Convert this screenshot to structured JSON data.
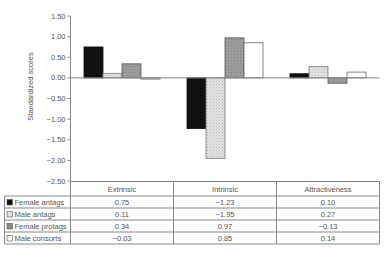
{
  "chart_data": {
    "type": "bar",
    "title": "",
    "xlabel": "",
    "ylabel": "Standardized scores",
    "ylim": [
      -2.5,
      1.5
    ],
    "yticks": [
      1.5,
      1.0,
      0.5,
      0.0,
      -0.5,
      -1.0,
      -1.5,
      -2.0,
      -2.5
    ],
    "ytick_labels": [
      "1.50",
      "1.00",
      "0.50",
      "0.00",
      "−0.50",
      "−1.00",
      "−1.50",
      "−2.00",
      "−2.50"
    ],
    "grid": false,
    "legend_position": "data-table-left",
    "categories": [
      "Extrinsic",
      "Intrinsic",
      "Attractiveness"
    ],
    "series": [
      {
        "name": "Female antags",
        "values": [
          0.75,
          -1.23,
          0.1
        ],
        "labels": [
          "0.75",
          "−1.23",
          "0.10"
        ],
        "fill": "#111111",
        "pattern": "solid-black"
      },
      {
        "name": "Male antags",
        "values": [
          0.11,
          -1.95,
          0.27
        ],
        "labels": [
          "0.11",
          "−1.95",
          "0.27"
        ],
        "fill": "#dcdcdc",
        "pattern": "light-dotted"
      },
      {
        "name": "Female protags",
        "values": [
          0.34,
          0.97,
          -0.13
        ],
        "labels": [
          "0.34",
          "0.97",
          "−0.13"
        ],
        "fill": "#9a9a9a",
        "pattern": "medium-gray"
      },
      {
        "name": "Male consorts",
        "values": [
          -0.03,
          0.85,
          0.14
        ],
        "labels": [
          "−0.03",
          "0.85",
          "0.14"
        ],
        "fill": "#ffffff",
        "pattern": "white"
      }
    ]
  }
}
